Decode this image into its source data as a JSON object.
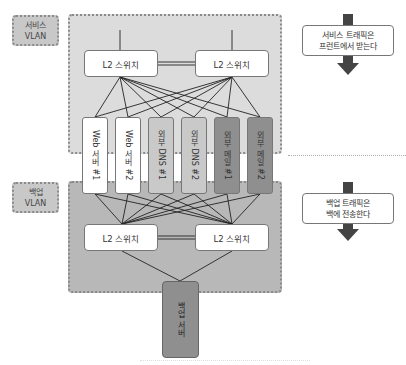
{
  "zones": {
    "service": {
      "label_line1": "서비스",
      "label_line2": "VLAN",
      "color": "#dcdcdc"
    },
    "backup": {
      "label_line1": "백업",
      "label_line2": "VLAN",
      "color": "#b8b8b8"
    }
  },
  "switches": {
    "service_left": "L2 스위치",
    "service_right": "L2 스위치",
    "backup_left": "L2 스위치",
    "backup_right": "L2 스위치"
  },
  "servers": [
    {
      "label": "Web 서버 #1",
      "shade": "white"
    },
    {
      "label": "Web 서버 #2",
      "shade": "white"
    },
    {
      "label": "외부 DNS #1",
      "shade": "light"
    },
    {
      "label": "외부 DNS #2",
      "shade": "light"
    },
    {
      "label": "외부 메일 #1",
      "shade": "dark"
    },
    {
      "label": "외부 메일 #2",
      "shade": "dark"
    }
  ],
  "backup_server": {
    "label": "백업 서버"
  },
  "callouts": {
    "service": {
      "line1": "서비스 트래픽은",
      "line2": "프런트에서 받는다"
    },
    "backup": {
      "line1": "백업 트래픽은",
      "line2": "백에 전송한다"
    }
  },
  "colors": {
    "arrow": "#444444",
    "border_dotted": "#8a8a8a",
    "server_dark": "#8f8f8f",
    "server_light": "#c9c9c9"
  }
}
